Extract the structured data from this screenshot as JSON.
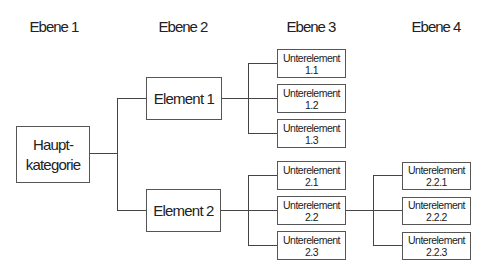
{
  "levels": [
    "Ebene 1",
    "Ebene 2",
    "Ebene 3",
    "Ebene 4"
  ],
  "root": {
    "line1": "Haupt-",
    "line2": "kategorie"
  },
  "level2": [
    {
      "label": "Element 1"
    },
    {
      "label": "Element 2"
    }
  ],
  "level3": [
    {
      "line1": "Unterelement",
      "line2": "1.1"
    },
    {
      "line1": "Unterelement",
      "line2": "1.2"
    },
    {
      "line1": "Unterelement",
      "line2": "1.3"
    },
    {
      "line1": "Unterelement",
      "line2": "2.1"
    },
    {
      "line1": "Unterelement",
      "line2": "2.2"
    },
    {
      "line1": "Unterelement",
      "line2": "2.3"
    }
  ],
  "level4": [
    {
      "line1": "Unterelement",
      "line2": "2.2.1"
    },
    {
      "line1": "Unterelement",
      "line2": "2.2.2"
    },
    {
      "line1": "Unterelement",
      "line2": "2.2.3"
    }
  ],
  "colors": {
    "line": "#444444",
    "border": "#555555",
    "text": "#222222"
  }
}
